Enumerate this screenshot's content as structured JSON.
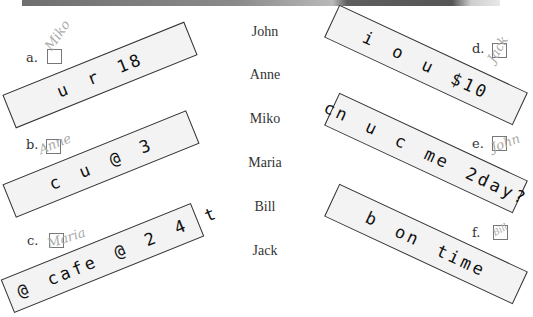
{
  "worksheet": {
    "names": [
      "John",
      "Anne",
      "Miko",
      "Maria",
      "Bill",
      "Jack"
    ],
    "items": [
      {
        "letter": "a.",
        "message": "u r 18",
        "handwritten_answer": "Miko"
      },
      {
        "letter": "b.",
        "message": "c u @ 3",
        "handwritten_answer": "Anne"
      },
      {
        "letter": "c.",
        "message": "b @ cafe @ 2 4 t",
        "handwritten_answer": "Maria"
      },
      {
        "letter": "d.",
        "message": "i o u $10",
        "handwritten_answer": "Jack"
      },
      {
        "letter": "e.",
        "message": "cn u c me 2day?",
        "handwritten_answer": "John"
      },
      {
        "letter": "f.",
        "message": "b on time",
        "handwritten_answer": "Bill"
      }
    ]
  },
  "colors": {
    "strip_fill": "#f3f3f3",
    "strip_border": "#333333",
    "handwriting": "#a9a9a9"
  }
}
